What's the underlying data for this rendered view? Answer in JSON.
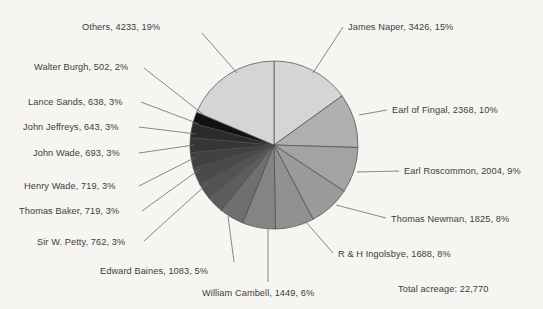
{
  "chart_data": {
    "type": "pie",
    "title": "",
    "total_label": "Total acreage: 22,770",
    "total_value": 22770,
    "unit": "acres",
    "legend": "none",
    "label_format": "name, value, percent",
    "start_angle_deg": 0,
    "direction": "clockwise",
    "categories": [
      "James Naper",
      "Earl of Fingal",
      "Earl Roscommon",
      "Thomas Newman",
      "R & H Ingolsbye",
      "William Cambell",
      "Edward Baines",
      "Sir W. Petty",
      "Thomas Baker",
      "Henry Wade",
      "John Wade",
      "John Jeffreys",
      "Lance Sands",
      "Walter Burgh",
      "Others"
    ],
    "values": [
      3426,
      2368,
      2004,
      1825,
      1688,
      1449,
      1083,
      762,
      719,
      719,
      693,
      643,
      638,
      502,
      4233
    ],
    "percents": [
      15,
      10,
      9,
      8,
      8,
      6,
      5,
      3,
      3,
      3,
      3,
      3,
      3,
      2,
      19
    ],
    "colors": [
      "#d5d5d5",
      "#b0b0b0",
      "#a3a3a3",
      "#9a9a9a",
      "#919191",
      "#848484",
      "#6f6f6f",
      "#5d5d5d",
      "#535353",
      "#4a4a4a",
      "#414141",
      "#363636",
      "#2b2b2b",
      "#111111",
      "#d5d5d5"
    ],
    "slice_stroke": "#4a4a4a",
    "background": "#f6f5f2",
    "text_color": "#3c3c3c",
    "center": {
      "x": 274,
      "y": 145
    },
    "radius": 84
  },
  "labels": [
    {
      "id": "others",
      "text": "Others, 4233, 19%",
      "side": "left",
      "x": 82,
      "y": 22,
      "lx": 202,
      "ly": 33,
      "ax": 237,
      "ay": 73
    },
    {
      "id": "walter-burgh",
      "text": "Walter Burgh, 502, 2%",
      "side": "left",
      "x": 34,
      "y": 62,
      "lx": 144,
      "ly": 68,
      "ax": 204,
      "ay": 115
    },
    {
      "id": "lance-sands",
      "text": "Lance Sands, 638, 3%",
      "side": "left",
      "x": 28,
      "y": 97,
      "lx": 141,
      "ly": 102,
      "ax": 199,
      "ay": 124
    },
    {
      "id": "john-jeffreys",
      "text": "John Jeffreys, 643, 3%",
      "side": "left",
      "x": 23,
      "y": 122,
      "lx": 139,
      "ly": 127,
      "ax": 196,
      "ay": 134
    },
    {
      "id": "john-wade",
      "text": "John Wade, 693, 3%",
      "side": "left",
      "x": 33,
      "y": 148,
      "lx": 139,
      "ly": 153,
      "ax": 194,
      "ay": 145
    },
    {
      "id": "henry-wade",
      "text": "Henry Wade, 719, 3%",
      "side": "left",
      "x": 24,
      "y": 181,
      "lx": 139,
      "ly": 186,
      "ax": 196,
      "ay": 157
    },
    {
      "id": "thomas-baker",
      "text": "Thomas Baker, 719, 3%",
      "side": "left",
      "x": 19,
      "y": 206,
      "lx": 142,
      "ly": 211,
      "ax": 200,
      "ay": 169
    },
    {
      "id": "sir-w-petty",
      "text": "Sir W. Petty, 762, 3%",
      "side": "left",
      "x": 37,
      "y": 237,
      "lx": 144,
      "ly": 241,
      "ax": 208,
      "ay": 183
    },
    {
      "id": "edward-baines",
      "text": "Edward Baines, 1083, 5%",
      "side": "left",
      "x": 100,
      "y": 266,
      "lx": 234,
      "ly": 262,
      "ax": 228,
      "ay": 216
    },
    {
      "id": "william-cambell",
      "text": "William Cambell, 1449, 6%",
      "side": "left",
      "x": 202,
      "y": 288,
      "lx": 268,
      "ly": 282,
      "ax": 268,
      "ay": 228
    },
    {
      "id": "james-naper",
      "text": "James Naper, 3426, 15%",
      "side": "right",
      "x": 348,
      "y": 22,
      "lx": 343,
      "ly": 27,
      "ax": 313,
      "ay": 73
    },
    {
      "id": "earl-of-fingal",
      "text": "Earl of Fingal, 2368, 10%",
      "side": "right",
      "x": 392,
      "y": 105,
      "lx": 387,
      "ly": 110,
      "ax": 359,
      "ay": 115
    },
    {
      "id": "earl-roscommon",
      "text": "Earl Roscommon, 2004, 9%",
      "side": "right",
      "x": 404,
      "y": 166,
      "lx": 399,
      "ly": 171,
      "ax": 357,
      "ay": 172
    },
    {
      "id": "thomas-newman",
      "text": "Thomas Newman, 1825, 8%",
      "side": "right",
      "x": 391,
      "y": 214,
      "lx": 386,
      "ly": 218,
      "ax": 336,
      "ay": 205
    },
    {
      "id": "r-h-ingolsbye",
      "text": "R & H Ingolsbye, 1688, 8%",
      "side": "right",
      "x": 338,
      "y": 249,
      "lx": 333,
      "ly": 253,
      "ax": 306,
      "ay": 222
    }
  ],
  "footer": {
    "total_acreage": "Total acreage: 22,770",
    "x": 398,
    "y": 284
  }
}
